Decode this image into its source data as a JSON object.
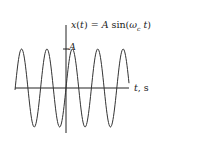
{
  "diagram": {
    "type": "sine-wave-plot",
    "equation_label": "x(t) = A sin(ω",
    "equation_subscript": "c",
    "equation_tail": " t)",
    "amplitude_label": "A",
    "x_axis_label": "t, s",
    "cycles_visible": 5,
    "colors": {
      "curve": "#333333",
      "axis": "#222222",
      "background": "#ffffff"
    }
  },
  "chart_data": {
    "type": "line",
    "xlabel": "t, s",
    "ylabel": "x(t)",
    "yticks": [
      "A"
    ],
    "function": "A*sin(omega_c*t)",
    "cycles_visible": 5,
    "grid": false
  }
}
